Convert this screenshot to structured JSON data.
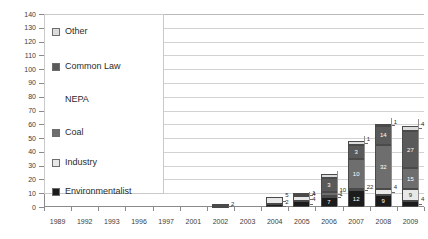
{
  "chart_data": {
    "type": "bar",
    "stacked": true,
    "title": "",
    "subtitle": "",
    "xlabel": "",
    "ylabel": "",
    "ylim": [
      0,
      140
    ],
    "ytick_step": 10,
    "grid": true,
    "legend_position": "inside-left",
    "categories": [
      "1989",
      "1992",
      "1993",
      "1996",
      "1997",
      "2001",
      "2002",
      "2003",
      "2004",
      "2005",
      "2006",
      "2007",
      "2008",
      "2009"
    ],
    "ytick_labels": [
      "0",
      "10",
      "20",
      "30",
      "40",
      "50",
      "60",
      "70",
      "80",
      "90",
      "100",
      "110",
      "120",
      "130",
      "140"
    ],
    "series": [
      {
        "name": "Environmentalist",
        "color": "#1c1c1c",
        "values": [
          0,
          0,
          0,
          0,
          0,
          0,
          1,
          0,
          2,
          4,
          7,
          12,
          9,
          4
        ]
      },
      {
        "name": "Industry",
        "color": "#e8e8e8",
        "values": [
          0,
          0,
          0,
          0,
          0,
          0,
          0,
          0,
          5,
          4,
          1,
          1,
          4,
          9
        ]
      },
      {
        "name": "Coal",
        "color": "#6e6e6e",
        "values": [
          0,
          0,
          0,
          0,
          0,
          0,
          0,
          0,
          0,
          1,
          3,
          22,
          32,
          15
        ]
      },
      {
        "name": "NEPA",
        "color": "#ffffff",
        "values": [
          0,
          0,
          0,
          0,
          0,
          0,
          0,
          0,
          0,
          0,
          0,
          0,
          0,
          0
        ]
      },
      {
        "name": "Common Law",
        "color": "#5a5a5a",
        "values": [
          0,
          0,
          0,
          0,
          0,
          0,
          0,
          0,
          0,
          1,
          10,
          10,
          14,
          27
        ]
      },
      {
        "name": "Other",
        "color": "#dcdcdc",
        "values": [
          0,
          0,
          0,
          0,
          0,
          0,
          1,
          0,
          0,
          0,
          3,
          3,
          1,
          4
        ]
      }
    ],
    "data_labels": {
      "1989": [],
      "1992": [],
      "1993": [],
      "1996": [],
      "1997": [],
      "2001": [],
      "2002": [
        "2"
      ],
      "2003": [],
      "2004": [
        "2",
        "5"
      ],
      "2005": [
        "4",
        "4",
        "1"
      ],
      "2006": [
        "7",
        "1",
        "10",
        "3"
      ],
      "2007": [
        "12",
        "22",
        "10",
        "3",
        "1"
      ],
      "2008": [
        "9",
        "4",
        "32",
        "14",
        "1"
      ],
      "2009": [
        "4",
        "9",
        "15",
        "27",
        "4"
      ]
    }
  },
  "legend": {
    "items": [
      {
        "label": "Other",
        "swatch": "#dcdcdc",
        "visible_swatch": true
      },
      {
        "label": "Common Law",
        "swatch": "#5a5a5a",
        "visible_swatch": true
      },
      {
        "label": "NEPA",
        "swatch": "#ffffff",
        "visible_swatch": false
      },
      {
        "label": "Coal",
        "swatch": "#6e6e6e",
        "visible_swatch": true
      },
      {
        "label": "Industry",
        "swatch": "#e8e8e8",
        "visible_swatch": true
      },
      {
        "label": "Environmentalist",
        "swatch": "#1c1c1c",
        "visible_swatch": true
      }
    ]
  },
  "colors": {
    "axis": "#8a8a8a",
    "grid": "#d2d2d2",
    "text": "#2b2b2b",
    "background": "#ffffff"
  }
}
